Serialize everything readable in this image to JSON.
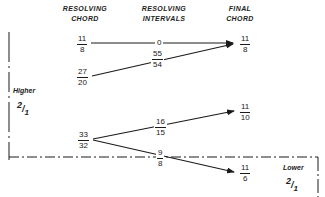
{
  "headers": {
    "resolving_chord": [
      "RESOLVING",
      "CHORD"
    ],
    "resolving_intervals": [
      "RESOLVING",
      "INTERVALS"
    ],
    "final_chord": [
      "FINAL",
      "CHORD"
    ]
  },
  "resolving_chords": [
    {
      "num": "11",
      "den": "8"
    },
    {
      "num": "27",
      "den": "20"
    },
    {
      "num": "33",
      "den": "32"
    }
  ],
  "intervals": [
    {
      "value": "0",
      "from": "11/8",
      "to": "11/8"
    },
    {
      "num": "55",
      "den": "54",
      "from": "27/20",
      "to": "11/8"
    },
    {
      "num": "16",
      "den": "15",
      "from": "33/32",
      "to": "11/10"
    },
    {
      "num": "9",
      "den": "8",
      "from": "33/32",
      "to": "11/6"
    }
  ],
  "final_chords": [
    {
      "num": "11",
      "den": "8"
    },
    {
      "num": "11",
      "den": "10"
    },
    {
      "num": "11",
      "den": "6"
    }
  ],
  "regions": {
    "higher": {
      "label": "Higher",
      "ratio": "2/1",
      "num": "2",
      "den": "1"
    },
    "lower": {
      "label": "Lower",
      "ratio": "2/1",
      "num": "2",
      "den": "1"
    }
  },
  "colors": {
    "ink": "#1a1a1a",
    "background": "#ffffff"
  }
}
